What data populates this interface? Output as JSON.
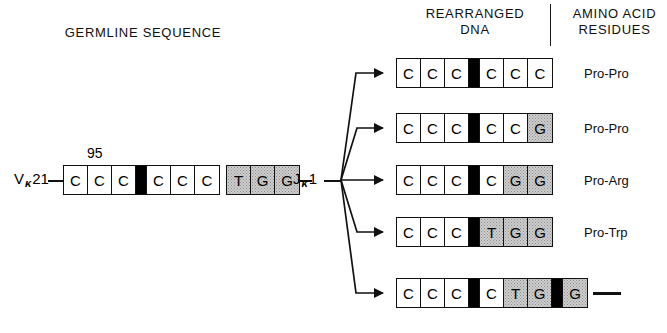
{
  "headings": {
    "germline": "GERMLINE SEQUENCE",
    "rearranged_line1": "REARRANGED",
    "rearranged_line2": "DNA",
    "amino_line1": "AMINO ACID",
    "amino_line2": "RESIDUES"
  },
  "germline": {
    "v_gene": {
      "letter": "V",
      "subscript": "κ",
      "number": "21"
    },
    "j_gene": {
      "letter": "J",
      "subscript": "κ",
      "number": "1"
    },
    "position_label": "95",
    "v_codons": [
      "C",
      "C",
      "C",
      "",
      "C",
      "C",
      "C"
    ],
    "v_styles": [
      "open",
      "open",
      "open",
      "black",
      "open",
      "open",
      "open"
    ],
    "j_codons": [
      "T",
      "G",
      "G"
    ],
    "j_styles": [
      "shaded",
      "shaded",
      "shaded"
    ]
  },
  "rearranged": [
    {
      "cells": [
        "C",
        "C",
        "C",
        "",
        "C",
        "C",
        "C"
      ],
      "styles": [
        "open",
        "open",
        "open",
        "black",
        "open",
        "open",
        "open"
      ],
      "amino": "Pro-Pro"
    },
    {
      "cells": [
        "C",
        "C",
        "C",
        "",
        "C",
        "C",
        "G"
      ],
      "styles": [
        "open",
        "open",
        "open",
        "black",
        "open",
        "open",
        "shaded"
      ],
      "amino": "Pro-Pro"
    },
    {
      "cells": [
        "C",
        "C",
        "C",
        "",
        "C",
        "G",
        "G"
      ],
      "styles": [
        "open",
        "open",
        "open",
        "black",
        "open",
        "shaded",
        "shaded"
      ],
      "amino": "Pro-Arg"
    },
    {
      "cells": [
        "C",
        "C",
        "C",
        "",
        "T",
        "G",
        "G"
      ],
      "styles": [
        "open",
        "open",
        "open",
        "black",
        "shaded",
        "shaded",
        "shaded"
      ],
      "amino": "Pro-Trp"
    },
    {
      "cells": [
        "C",
        "C",
        "C",
        "",
        "C",
        "T",
        "G",
        "",
        "G"
      ],
      "styles": [
        "open",
        "open",
        "open",
        "black",
        "open",
        "shaded",
        "shaded",
        "black",
        "shaded"
      ],
      "amino": "—"
    }
  ],
  "colors": {
    "ink": "#111111",
    "paper": "#ffffff",
    "black_insert": "#000000",
    "shaded_fill": "#cfcfcf"
  },
  "icons": {
    "branch": "branch-arrow-icon"
  }
}
